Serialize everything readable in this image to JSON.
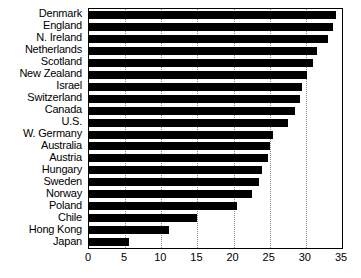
{
  "chart_data": {
    "type": "bar",
    "orientation": "horizontal",
    "title": "",
    "subtitle": "",
    "xlabel": "",
    "ylabel": "",
    "xlim": [
      0,
      35
    ],
    "xticks": [
      0,
      5,
      10,
      15,
      20,
      25,
      30,
      35
    ],
    "xtick_labels": [
      "0",
      "5",
      "10",
      "15",
      "20",
      "25",
      "30",
      "35"
    ],
    "grid": true,
    "grid_axis": "x",
    "grid_style": "dotted",
    "legend": false,
    "bar_color": "#000000",
    "categories": [
      "Denmark",
      "England",
      "N. Ireland",
      "Netherlands",
      "Scotland",
      "New Zealand",
      "Israel",
      "Switzerland",
      "Canada",
      "U.S.",
      "W. Germany",
      "Australia",
      "Austria",
      "Hungary",
      "Sweden",
      "Norway",
      "Poland",
      "Chile",
      "Hong Kong",
      "Japan"
    ],
    "values": [
      34.2,
      33.8,
      33.0,
      31.5,
      31.0,
      30.2,
      29.5,
      29.2,
      28.5,
      27.5,
      25.5,
      25.0,
      24.8,
      24.0,
      23.5,
      22.5,
      20.5,
      15.0,
      11.0,
      5.5
    ]
  }
}
